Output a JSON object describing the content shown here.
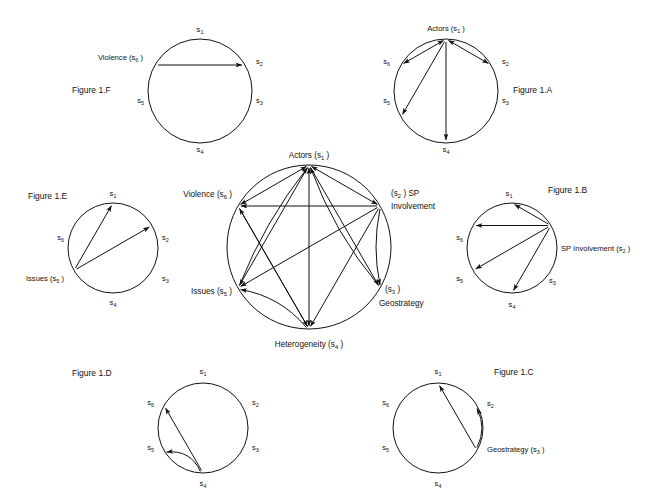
{
  "page": {
    "width": 660,
    "height": 501,
    "background": "#ffffff",
    "ink": "#111111"
  },
  "glyphs": {
    "s1": "s",
    "s1_sub": "1",
    "s2": "s",
    "s2_sub": "2",
    "s3": "s",
    "s3_sub": "3",
    "s4": "s",
    "s4_sub": "4",
    "s5": "s",
    "s5_sub": "5",
    "s6": "s",
    "s6_sub": "6"
  },
  "figures": [
    {
      "id": "fig-1f",
      "caption": "Figure 1.F",
      "caption_x": 72,
      "caption_y": 93,
      "cx": 200,
      "cy": 91,
      "r": 52,
      "focus": "s6",
      "nodes": [
        {
          "key": "s1",
          "base": "s",
          "sub": "1",
          "prefix": "",
          "suffix": "",
          "anchor": "middle",
          "lx": 200,
          "ly": 32,
          "big": false
        },
        {
          "key": "s2",
          "base": "s",
          "sub": "2",
          "prefix": "",
          "suffix": "",
          "anchor": "start",
          "lx": 256,
          "ly": 64,
          "big": false
        },
        {
          "key": "s3",
          "base": "s",
          "sub": "3",
          "prefix": "",
          "suffix": "",
          "anchor": "start",
          "lx": 256,
          "ly": 103,
          "big": false
        },
        {
          "key": "s4",
          "base": "s",
          "sub": "4",
          "prefix": "",
          "suffix": "",
          "anchor": "middle",
          "lx": 200,
          "ly": 152,
          "big": false
        },
        {
          "key": "s5",
          "base": "s",
          "sub": "5",
          "prefix": "",
          "suffix": "",
          "anchor": "end",
          "lx": 144,
          "ly": 103,
          "big": false
        },
        {
          "key": "s6",
          "base": "s",
          "sub": "6",
          "prefix": "Violence (",
          "suffix": " )",
          "anchor": "end",
          "lx": 143,
          "ly": 60,
          "big": false
        }
      ],
      "edges": [
        {
          "from": "s6",
          "to": "s2",
          "bow": 0,
          "double": false
        }
      ]
    },
    {
      "id": "fig-1a",
      "caption": "Figure 1.A",
      "caption_x": 513,
      "caption_y": 93,
      "cx": 446,
      "cy": 91,
      "r": 52,
      "focus": "s1",
      "nodes": [
        {
          "key": "s1",
          "base": "s",
          "sub": "1",
          "prefix": "Actors (",
          "suffix": " )",
          "anchor": "middle",
          "lx": 446,
          "ly": 31,
          "big": false
        },
        {
          "key": "s2",
          "base": "s",
          "sub": "2",
          "prefix": "",
          "suffix": "",
          "anchor": "start",
          "lx": 502,
          "ly": 64,
          "big": false
        },
        {
          "key": "s3",
          "base": "s",
          "sub": "3",
          "prefix": "",
          "suffix": "",
          "anchor": "start",
          "lx": 502,
          "ly": 103,
          "big": false
        },
        {
          "key": "s4",
          "base": "s",
          "sub": "4",
          "prefix": "",
          "suffix": "",
          "anchor": "middle",
          "lx": 446,
          "ly": 152,
          "big": false
        },
        {
          "key": "s5",
          "base": "s",
          "sub": "5",
          "prefix": "",
          "suffix": "",
          "anchor": "end",
          "lx": 390,
          "ly": 103,
          "big": false
        },
        {
          "key": "s6",
          "base": "s",
          "sub": "6",
          "prefix": "",
          "suffix": "",
          "anchor": "end",
          "lx": 390,
          "ly": 64,
          "big": false
        }
      ],
      "edges": [
        {
          "from": "s1",
          "to": "s2",
          "bow": 0,
          "double": true
        },
        {
          "from": "s1",
          "to": "s6",
          "bow": 0,
          "double": true
        },
        {
          "from": "s1",
          "to": "s5",
          "bow": 0,
          "double": false
        },
        {
          "from": "s1",
          "to": "s4",
          "bow": 0,
          "double": false
        }
      ]
    },
    {
      "id": "fig-1e",
      "caption": "Figure 1.E",
      "caption_x": 28,
      "caption_y": 199,
      "cx": 113,
      "cy": 248,
      "r": 45,
      "focus": "s5",
      "nodes": [
        {
          "key": "s1",
          "base": "s",
          "sub": "1",
          "prefix": "",
          "suffix": "",
          "anchor": "middle",
          "lx": 113,
          "ly": 196,
          "big": false
        },
        {
          "key": "s2",
          "base": "s",
          "sub": "2",
          "prefix": "",
          "suffix": "",
          "anchor": "start",
          "lx": 162,
          "ly": 240,
          "big": false
        },
        {
          "key": "s3",
          "base": "s",
          "sub": "3",
          "prefix": "",
          "suffix": "",
          "anchor": "start",
          "lx": 162,
          "ly": 281,
          "big": false
        },
        {
          "key": "s4",
          "base": "s",
          "sub": "4",
          "prefix": "",
          "suffix": "",
          "anchor": "middle",
          "lx": 113,
          "ly": 305,
          "big": false
        },
        {
          "key": "s5",
          "base": "s",
          "sub": "5",
          "prefix": "Issues (",
          "suffix": " )",
          "anchor": "end",
          "lx": 64,
          "ly": 281,
          "big": false
        },
        {
          "key": "s6",
          "base": "s",
          "sub": "6",
          "prefix": "",
          "suffix": "",
          "anchor": "end",
          "lx": 64,
          "ly": 240,
          "big": false
        }
      ],
      "edges": [
        {
          "from": "s5",
          "to": "s1",
          "bow": 0,
          "double": false
        },
        {
          "from": "s5",
          "to": "s2",
          "bow": 0,
          "double": false
        }
      ]
    },
    {
      "id": "fig-1b",
      "caption": "Figure 1.B",
      "caption_x": 548,
      "caption_y": 193,
      "cx": 512,
      "cy": 248,
      "r": 45,
      "focus": "s2",
      "nodes": [
        {
          "key": "s1",
          "base": "s",
          "sub": "1",
          "prefix": "",
          "suffix": "",
          "anchor": "middle",
          "lx": 509,
          "ly": 196,
          "big": false
        },
        {
          "key": "s2",
          "base": "s",
          "sub": "2",
          "prefix": "SP Involvement (",
          "suffix": " )",
          "anchor": "start",
          "lx": 561,
          "ly": 251,
          "big": false
        },
        {
          "key": "s3",
          "base": "s",
          "sub": "3",
          "prefix": "",
          "suffix": "",
          "anchor": "start",
          "lx": 549,
          "ly": 283,
          "big": false
        },
        {
          "key": "s4",
          "base": "s",
          "sub": "4",
          "prefix": "",
          "suffix": "",
          "anchor": "middle",
          "lx": 512,
          "ly": 307,
          "big": false
        },
        {
          "key": "s5",
          "base": "s",
          "sub": "5",
          "prefix": "",
          "suffix": "",
          "anchor": "end",
          "lx": 463,
          "ly": 281,
          "big": false
        },
        {
          "key": "s6",
          "base": "s",
          "sub": "6",
          "prefix": "",
          "suffix": "",
          "anchor": "end",
          "lx": 463,
          "ly": 240,
          "big": false
        }
      ],
      "edges": [
        {
          "from": "s2",
          "to": "s1",
          "bow": 0,
          "double": false
        },
        {
          "from": "s2",
          "to": "s6",
          "bow": 0,
          "double": false
        },
        {
          "from": "s2",
          "to": "s5",
          "bow": 0,
          "double": false
        },
        {
          "from": "s2",
          "to": "s4",
          "bow": 0,
          "double": false
        }
      ]
    },
    {
      "id": "fig-1d",
      "caption": "Figure 1.D",
      "caption_x": 72,
      "caption_y": 376,
      "cx": 203,
      "cy": 428,
      "r": 45,
      "focus": "s4",
      "nodes": [
        {
          "key": "s1",
          "base": "s",
          "sub": "1",
          "prefix": "",
          "suffix": "",
          "anchor": "middle",
          "lx": 203,
          "ly": 374,
          "big": false
        },
        {
          "key": "s2",
          "base": "s",
          "sub": "2",
          "prefix": "",
          "suffix": "",
          "anchor": "start",
          "lx": 252,
          "ly": 405,
          "big": false
        },
        {
          "key": "s3",
          "base": "s",
          "sub": "3",
          "prefix": "",
          "suffix": "",
          "anchor": "start",
          "lx": 252,
          "ly": 450,
          "big": false
        },
        {
          "key": "s4",
          "base": "s",
          "sub": "4",
          "prefix": "",
          "suffix": "",
          "anchor": "middle",
          "lx": 203,
          "ly": 486,
          "big": false
        },
        {
          "key": "s5",
          "base": "s",
          "sub": "5",
          "prefix": "",
          "suffix": "",
          "anchor": "end",
          "lx": 154,
          "ly": 450,
          "big": false
        },
        {
          "key": "s6",
          "base": "s",
          "sub": "6",
          "prefix": "",
          "suffix": "",
          "anchor": "end",
          "lx": 154,
          "ly": 405,
          "big": false
        }
      ],
      "edges": [
        {
          "from": "s4",
          "to": "s6",
          "bow": 0,
          "double": false
        },
        {
          "from": "s4",
          "to": "s5",
          "bow": 7,
          "double": false
        }
      ]
    },
    {
      "id": "fig-1c",
      "caption": "Figure 1.C",
      "caption_x": 494,
      "caption_y": 375,
      "cx": 438,
      "cy": 428,
      "r": 45,
      "focus": "s3",
      "nodes": [
        {
          "key": "s1",
          "base": "s",
          "sub": "1",
          "prefix": "",
          "suffix": "",
          "anchor": "middle",
          "lx": 438,
          "ly": 374,
          "big": false
        },
        {
          "key": "s2",
          "base": "s",
          "sub": "2",
          "prefix": "",
          "suffix": "",
          "anchor": "start",
          "lx": 487,
          "ly": 406,
          "big": false
        },
        {
          "key": "s3",
          "base": "s",
          "sub": "3",
          "prefix": "Geostrategy (",
          "suffix": " )",
          "anchor": "start",
          "lx": 487,
          "ly": 452,
          "big": false
        },
        {
          "key": "s4",
          "base": "s",
          "sub": "4",
          "prefix": "",
          "suffix": "",
          "anchor": "middle",
          "lx": 438,
          "ly": 486,
          "big": false
        },
        {
          "key": "s5",
          "base": "s",
          "sub": "5",
          "prefix": "",
          "suffix": "",
          "anchor": "end",
          "lx": 389,
          "ly": 450,
          "big": false
        },
        {
          "key": "s6",
          "base": "s",
          "sub": "6",
          "prefix": "",
          "suffix": "",
          "anchor": "end",
          "lx": 389,
          "ly": 405,
          "big": false
        }
      ],
      "edges": [
        {
          "from": "s3",
          "to": "s1",
          "bow": 0,
          "double": false
        },
        {
          "from": "s3",
          "to": "s2",
          "bow": 5,
          "double": false
        }
      ]
    },
    {
      "id": "fig-1-center",
      "caption": "",
      "caption_x": 0,
      "caption_y": 0,
      "cx": 309,
      "cy": 247,
      "r": 82,
      "focus": "",
      "nodes": [
        {
          "key": "s1",
          "base": "s",
          "sub": "1",
          "prefix": "Actors (",
          "suffix": " )",
          "anchor": "middle",
          "lx": 309,
          "ly": 158,
          "big": true
        },
        {
          "key": "s2",
          "base": "s",
          "sub": "2",
          "prefix": "(",
          "suffix": " ) SP",
          "anchor": "start",
          "lx": 391,
          "ly": 196,
          "big": true
        },
        {
          "key": "s2b",
          "base": "",
          "sub": "",
          "prefix": "Involvement",
          "suffix": "",
          "anchor": "start",
          "lx": 391,
          "ly": 209,
          "big": true
        },
        {
          "key": "s3",
          "base": "s",
          "sub": "3",
          "prefix": "(",
          "suffix": " )",
          "anchor": "start",
          "lx": 385,
          "ly": 292,
          "big": true
        },
        {
          "key": "s3b",
          "base": "",
          "sub": "",
          "prefix": "Geostrategy",
          "suffix": "",
          "anchor": "start",
          "lx": 379,
          "ly": 306,
          "big": true
        },
        {
          "key": "s4",
          "base": "s",
          "sub": "4",
          "prefix": "Heterogeneity (",
          "suffix": " )",
          "anchor": "middle",
          "lx": 309,
          "ly": 347,
          "big": true
        },
        {
          "key": "s5",
          "base": "s",
          "sub": "5",
          "prefix": "Issues (",
          "suffix": " )",
          "anchor": "end",
          "lx": 232,
          "ly": 294,
          "big": true
        },
        {
          "key": "s6",
          "base": "s",
          "sub": "6",
          "prefix": "Violence (",
          "suffix": " )",
          "anchor": "end",
          "lx": 232,
          "ly": 197,
          "big": true
        }
      ],
      "edges": [
        {
          "from": "s1",
          "to": "s2",
          "bow": 0,
          "double": true
        },
        {
          "from": "s1",
          "to": "s6",
          "bow": 0,
          "double": true
        },
        {
          "from": "s1",
          "to": "s5",
          "bow": 0,
          "double": false
        },
        {
          "from": "s1",
          "to": "s4",
          "bow": 0,
          "double": true
        },
        {
          "from": "s1",
          "to": "s3",
          "bow": 0,
          "double": false
        },
        {
          "from": "s2",
          "to": "s6",
          "bow": 0,
          "double": false
        },
        {
          "from": "s2",
          "to": "s5",
          "bow": 0,
          "double": false
        },
        {
          "from": "s2",
          "to": "s4",
          "bow": 0,
          "double": false
        },
        {
          "from": "s2",
          "to": "s3",
          "bow": 4,
          "double": false
        },
        {
          "from": "s3",
          "to": "s1",
          "bow": -6,
          "double": false
        },
        {
          "from": "s4",
          "to": "s5",
          "bow": 7,
          "double": false
        },
        {
          "from": "s4",
          "to": "s6",
          "bow": 0,
          "double": false
        },
        {
          "from": "s5",
          "to": "s1",
          "bow": -5,
          "double": false
        },
        {
          "from": "s6",
          "to": "s4",
          "bow": 0,
          "double": false
        }
      ]
    }
  ]
}
